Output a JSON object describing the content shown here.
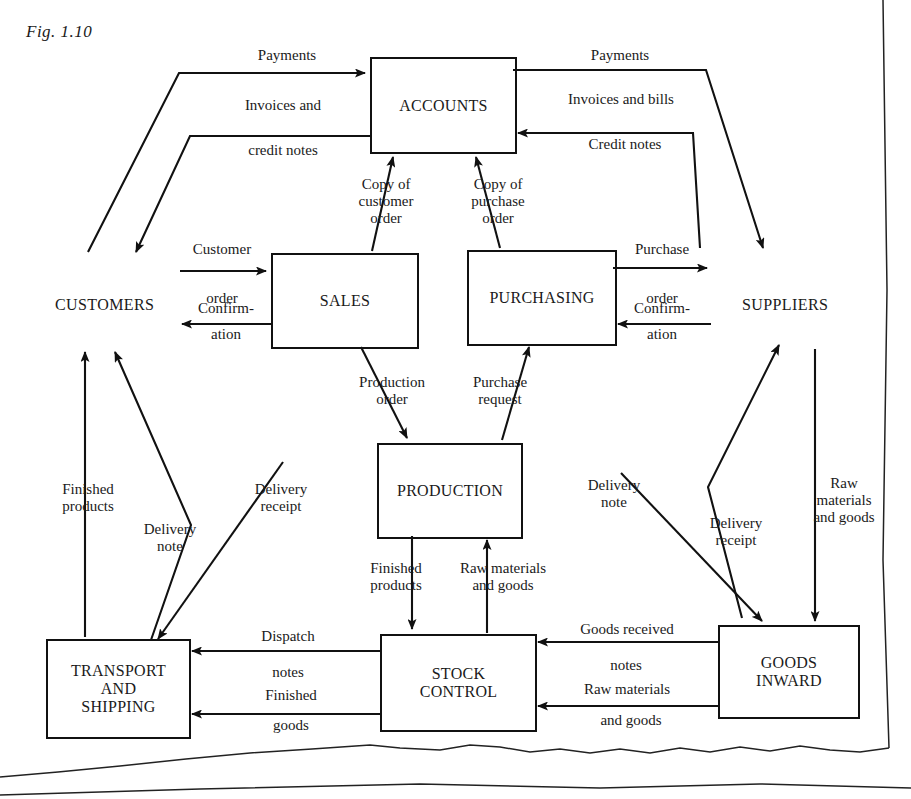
{
  "figure": {
    "caption": "Fig. 1.10"
  },
  "diagram": {
    "type": "data-flow-diagram",
    "title": "Fig. 1.10",
    "colors": {
      "ink": "#111111",
      "paper": "#ffffff"
    },
    "process_boxes": [
      {
        "id": "accounts",
        "label": "ACCOUNTS",
        "x": 370,
        "y": 57,
        "w": 143,
        "h": 93
      },
      {
        "id": "sales",
        "label": "SALES",
        "x": 271,
        "y": 253,
        "w": 144,
        "h": 92
      },
      {
        "id": "purchasing",
        "label": "PURCHASING",
        "x": 467,
        "y": 250,
        "w": 146,
        "h": 92
      },
      {
        "id": "production",
        "label": "PRODUCTION",
        "x": 377,
        "y": 443,
        "w": 142,
        "h": 92
      },
      {
        "id": "transport",
        "label": "TRANSPORT\nAND\nSHIPPING",
        "x": 46,
        "y": 639,
        "w": 141,
        "h": 96
      },
      {
        "id": "stock",
        "label": "STOCK\nCONTROL",
        "x": 380,
        "y": 634,
        "w": 153,
        "h": 94
      },
      {
        "id": "goods_in",
        "label": "GOODS\nINWARD",
        "x": 718,
        "y": 625,
        "w": 138,
        "h": 90
      }
    ],
    "external_entities": [
      {
        "id": "customers",
        "label": "CUSTOMERS",
        "x": 55,
        "y": 296
      },
      {
        "id": "suppliers",
        "label": "SUPPLIERS",
        "x": 742,
        "y": 296
      }
    ],
    "flow_labels": [
      {
        "id": "payments-left",
        "text": "Payments",
        "x": 232,
        "y": 47,
        "w": 110,
        "align": "center"
      },
      {
        "id": "invoices-credit",
        "text": "Invoices and",
        "x": 218,
        "y": 97,
        "w": 130,
        "align": "center"
      },
      {
        "id": "credit-notes-left",
        "text": "credit notes",
        "x": 218,
        "y": 142,
        "w": 130,
        "align": "center"
      },
      {
        "id": "payments-right",
        "text": "Payments",
        "x": 560,
        "y": 47,
        "w": 120,
        "align": "center"
      },
      {
        "id": "invoices-bills",
        "text": "Invoices and bills",
        "x": 536,
        "y": 91,
        "w": 170,
        "align": "center"
      },
      {
        "id": "credit-notes-right",
        "text": "Credit notes",
        "x": 555,
        "y": 136,
        "w": 140,
        "align": "center"
      },
      {
        "id": "copy-customer-order",
        "text": "Copy of\ncustomer\norder",
        "x": 340,
        "y": 176,
        "w": 92,
        "align": "center"
      },
      {
        "id": "copy-purchase-order",
        "text": "Copy of\npurchase\norder",
        "x": 452,
        "y": 176,
        "w": 92,
        "align": "center"
      },
      {
        "id": "customer-order",
        "text": "Customer",
        "x": 176,
        "y": 241,
        "w": 92,
        "align": "center"
      },
      {
        "id": "customer-order-2",
        "text": "order",
        "x": 176,
        "y": 290,
        "w": 92,
        "align": "center"
      },
      {
        "id": "confirmation-left",
        "text": "Confirm-",
        "x": 183,
        "y": 300,
        "w": 86,
        "align": "center"
      },
      {
        "id": "confirmation-left-2",
        "text": "ation",
        "x": 183,
        "y": 326,
        "w": 86,
        "align": "center"
      },
      {
        "id": "purchase-order",
        "text": "Purchase",
        "x": 616,
        "y": 241,
        "w": 92,
        "align": "center"
      },
      {
        "id": "purchase-order-2",
        "text": "order",
        "x": 616,
        "y": 290,
        "w": 92,
        "align": "center"
      },
      {
        "id": "confirmation-right",
        "text": "Confirm-",
        "x": 619,
        "y": 300,
        "w": 86,
        "align": "center"
      },
      {
        "id": "confirmation-right-2",
        "text": "ation",
        "x": 619,
        "y": 326,
        "w": 86,
        "align": "center"
      },
      {
        "id": "production-order",
        "text": "Production\norder",
        "x": 340,
        "y": 374,
        "w": 104,
        "align": "center"
      },
      {
        "id": "purchase-request",
        "text": "Purchase\nrequest",
        "x": 452,
        "y": 374,
        "w": 96,
        "align": "center"
      },
      {
        "id": "finished-products-mid",
        "text": "Finished\nproducts",
        "x": 350,
        "y": 560,
        "w": 92,
        "align": "center"
      },
      {
        "id": "raw-materials-mid",
        "text": "Raw materials\nand goods",
        "x": 446,
        "y": 560,
        "w": 114,
        "align": "center"
      },
      {
        "id": "finished-products-l",
        "text": "Finished\nproducts",
        "x": 42,
        "y": 481,
        "w": 92,
        "align": "center"
      },
      {
        "id": "delivery-note-l",
        "text": "Delivery\nnote",
        "x": 128,
        "y": 521,
        "w": 84,
        "align": "center"
      },
      {
        "id": "delivery-receipt-l",
        "text": "Delivery\nreceipt",
        "x": 237,
        "y": 481,
        "w": 88,
        "align": "center"
      },
      {
        "id": "delivery-note-r",
        "text": "Delivery\nnote",
        "x": 572,
        "y": 477,
        "w": 84,
        "align": "center"
      },
      {
        "id": "delivery-receipt-r",
        "text": "Delivery\nreceipt",
        "x": 692,
        "y": 515,
        "w": 88,
        "align": "center"
      },
      {
        "id": "raw-materials-r",
        "text": "Raw\nmaterials\nand goods",
        "x": 796,
        "y": 475,
        "w": 96,
        "align": "center"
      },
      {
        "id": "dispatch-notes",
        "text": "Dispatch",
        "x": 240,
        "y": 628,
        "w": 96,
        "align": "center"
      },
      {
        "id": "dispatch-notes-2",
        "text": "notes",
        "x": 240,
        "y": 664,
        "w": 96,
        "align": "center"
      },
      {
        "id": "finished-goods",
        "text": "Finished",
        "x": 243,
        "y": 687,
        "w": 96,
        "align": "center"
      },
      {
        "id": "finished-goods-2",
        "text": "goods",
        "x": 243,
        "y": 717,
        "w": 96,
        "align": "center"
      },
      {
        "id": "goods-received-notes",
        "text": "Goods received",
        "x": 552,
        "y": 621,
        "w": 150,
        "align": "center"
      },
      {
        "id": "goods-received-notes-2",
        "text": "notes",
        "x": 578,
        "y": 657,
        "w": 96,
        "align": "center"
      },
      {
        "id": "raw-materials-bottom",
        "text": "Raw materials",
        "x": 552,
        "y": 681,
        "w": 150,
        "align": "center"
      },
      {
        "id": "raw-materials-bottom-2",
        "text": "and goods",
        "x": 556,
        "y": 712,
        "w": 150,
        "align": "center"
      }
    ]
  }
}
